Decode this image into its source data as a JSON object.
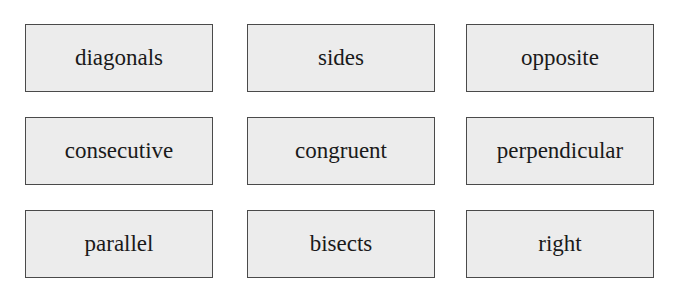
{
  "word_bank": {
    "rows": [
      [
        "diagonals",
        "sides",
        "opposite"
      ],
      [
        "consecutive",
        "congruent",
        "perpendicular"
      ],
      [
        "parallel",
        "bisects",
        "right"
      ]
    ]
  }
}
